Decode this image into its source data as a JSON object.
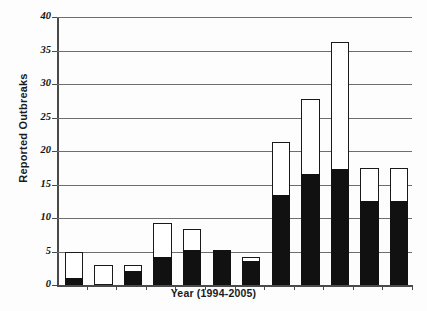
{
  "chart_data": {
    "type": "bar",
    "title": "",
    "subtitle": "",
    "xlabel": "Year (1994-2005)",
    "ylabel": "Reported Outbreaks",
    "ylim": [
      0,
      40
    ],
    "yticks": [
      0,
      5,
      10,
      15,
      20,
      25,
      30,
      35,
      40
    ],
    "ytick_labels": [
      "0",
      "5",
      "10",
      "15",
      "20",
      "25",
      "30",
      "35",
      "40"
    ],
    "grid": true,
    "grid_axis": "y",
    "legend": "none",
    "stacked": true,
    "categories": [
      "1994",
      "1995",
      "1996",
      "1997",
      "1998",
      "1999",
      "2000",
      "2001",
      "2002",
      "2003",
      "2004",
      "2005"
    ],
    "xtick_labels_visible": false,
    "series": [
      {
        "name": "black-segment",
        "color": "#111111",
        "values": [
          1.0,
          0.0,
          2.1,
          4.2,
          5.2,
          5.2,
          3.6,
          13.5,
          16.5,
          17.3,
          12.5,
          12.5
        ]
      },
      {
        "name": "white-segment",
        "color": "#ffffff",
        "values": [
          4.0,
          3.0,
          0.9,
          5.1,
          3.1,
          0.0,
          0.6,
          7.8,
          11.2,
          19.0,
          5.0,
          5.0
        ]
      }
    ],
    "totals": [
      5.0,
      3.0,
      3.0,
      9.3,
      8.3,
      5.2,
      4.2,
      21.3,
      27.7,
      36.3,
      17.5,
      17.5
    ]
  },
  "axis": {
    "y_title": "Reported Outbreaks",
    "x_title": "Year (1994-2005)"
  },
  "colors": {
    "bar_fill_dark": "#111111",
    "bar_fill_light": "#ffffff",
    "bar_stroke": "#1a1a1a",
    "axis": "#4a4a4a",
    "gridline": "#6e6e6e",
    "background": "#fdfdfd"
  }
}
